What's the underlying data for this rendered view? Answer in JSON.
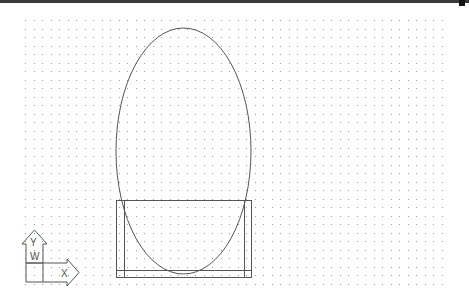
{
  "app": {
    "type": "cad-drawing-viewport"
  },
  "viewport": {
    "width": 469,
    "height": 306,
    "background": "#ffffff",
    "grid": {
      "visible": true,
      "x_start": 25,
      "y_start": 20,
      "x_end": 442,
      "y_end": 285,
      "spacing": 8.5,
      "dot_color": "#9a9a9a"
    }
  },
  "entities": {
    "ellipse": {
      "cx": 183.5,
      "cy": 151,
      "rx": 67.5,
      "ry": 123,
      "stroke": "#555555"
    },
    "outer_rect": {
      "x": 116,
      "y": 200,
      "width": 135,
      "height": 77,
      "stroke": "#555555"
    },
    "inner_left_line": {
      "x": 124,
      "y1": 200,
      "y2": 277
    },
    "inner_right_line": {
      "x": 244,
      "y1": 200,
      "y2": 277
    },
    "bottom_inner_line": {
      "y": 270,
      "x1": 116,
      "x2": 251
    }
  },
  "ucs_icon": {
    "y_label": "Y",
    "x_label": "X",
    "w_label": "W",
    "stroke": "#555555"
  },
  "colors": {
    "topbar": "#3a3a3a",
    "linework": "#555555"
  }
}
